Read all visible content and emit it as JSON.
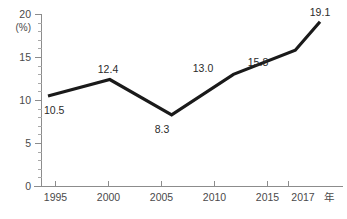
{
  "chart_data": {
    "type": "line",
    "title": "",
    "xlabel": "年",
    "ylabel": "(%)",
    "categories": [
      "1995",
      "2000",
      "2005",
      "2010",
      "2015",
      "2017"
    ],
    "x": [
      1995,
      2000,
      2005,
      2010,
      2015,
      2017
    ],
    "values": [
      10.5,
      12.4,
      8.3,
      13.0,
      15.8,
      19.1
    ],
    "point_labels": [
      "10.5",
      "12.4",
      "8.3",
      "13.0",
      "15.8",
      "19.1"
    ],
    "ylim": [
      0,
      20
    ],
    "xlim": [
      1993,
      2018.5
    ],
    "y_ticks": [
      "0",
      "5",
      "10",
      "15",
      "20"
    ],
    "y_tick_values": [
      0,
      5,
      10,
      15,
      20
    ],
    "y_minor_interval": 1,
    "x_ticks": [
      "1995",
      "2000",
      "2005",
      "2010",
      "2015",
      "2017"
    ],
    "grid": false,
    "legend": false,
    "legend_position": "none",
    "series": [
      {
        "name": "",
        "values": [
          10.5,
          12.4,
          8.3,
          13.0,
          15.8,
          19.1
        ],
        "color": "#1a1a1a"
      }
    ],
    "colors": {
      "line": "#1a1a1a",
      "axis": "#8c8c8c",
      "tick_minor": "#a8a8a8",
      "axis_text": "#4a4a4a",
      "label_text": "#2b2b2b",
      "background": "#ffffff"
    },
    "axis_unit_label": "(%)",
    "x_axis_suffix": "年"
  }
}
